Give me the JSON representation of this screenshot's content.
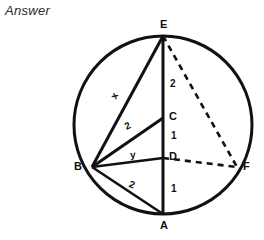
{
  "page": {
    "heading": "Answer",
    "background_color": "#ffffff",
    "ink_color": "#111111"
  },
  "figure": {
    "name": "circle-geometry-diagram",
    "circle": {
      "cx": 163,
      "cy": 125,
      "r": 89
    },
    "points": [
      {
        "id": "E",
        "label": "E",
        "x": 163,
        "y": 36,
        "label_x": 160,
        "label_y": 20
      },
      {
        "id": "B",
        "label": "B",
        "x": 92,
        "y": 167,
        "label_x": 74,
        "label_y": 162
      },
      {
        "id": "F",
        "label": "F",
        "x": 237,
        "y": 167,
        "label_x": 243,
        "label_y": 162
      },
      {
        "id": "A",
        "label": "A",
        "x": 163,
        "y": 214,
        "label_x": 160,
        "label_y": 221
      },
      {
        "id": "C",
        "label": "C",
        "x": 163,
        "y": 118,
        "label_x": 169,
        "label_y": 112
      },
      {
        "id": "D",
        "label": "D",
        "x": 163,
        "y": 158,
        "label_x": 169,
        "label_y": 152
      }
    ],
    "segments": [
      {
        "id": "EA",
        "from": "E",
        "to": "A",
        "style": "solid"
      },
      {
        "id": "EB",
        "from": "E",
        "to": "B",
        "style": "solid"
      },
      {
        "id": "EF",
        "from": "E",
        "to": "F",
        "style": "dashed"
      },
      {
        "id": "BC",
        "from": "B",
        "to": "C",
        "style": "solid"
      },
      {
        "id": "BD",
        "from": "B",
        "to": "D",
        "style": "solid"
      },
      {
        "id": "BA",
        "from": "B",
        "to": "A",
        "style": "solid"
      },
      {
        "id": "DF",
        "from": "D",
        "to": "F",
        "style": "dashed"
      }
    ],
    "segment_labels": [
      {
        "id": "EB-len",
        "text": "x",
        "x": 113,
        "y": 94,
        "tilt": "tilt-x"
      },
      {
        "id": "BC-len",
        "text": "2",
        "x": 126,
        "y": 124,
        "tilt": "tilt-b"
      },
      {
        "id": "BD-len",
        "text": "y",
        "x": 131,
        "y": 152,
        "tilt": "tilt-y"
      },
      {
        "id": "BA-len",
        "text": "2",
        "x": 130,
        "y": 182,
        "tilt": "tilt-ba"
      },
      {
        "id": "EC-len",
        "text": "2",
        "x": 170,
        "y": 82,
        "tilt": ""
      },
      {
        "id": "CD-len",
        "text": "1",
        "x": 171,
        "y": 133,
        "tilt": ""
      },
      {
        "id": "DA-len",
        "text": "1",
        "x": 171,
        "y": 186,
        "tilt": ""
      }
    ]
  }
}
